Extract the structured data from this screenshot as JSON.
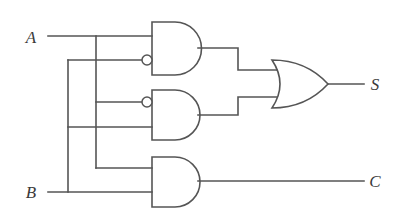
{
  "diagram": {
    "kind": "half-adder-logic-diagram",
    "background_color": "#ffffff",
    "line_color": "#555555",
    "label_color": "#3a3a3a"
  },
  "inputs": [
    {
      "id": "A",
      "label": "A",
      "x": 31,
      "y": 38,
      "wire_y": 36
    },
    {
      "id": "B",
      "label": "B",
      "x": 31,
      "y": 193,
      "wire_y": 192
    }
  ],
  "outputs": [
    {
      "id": "S",
      "label": "S",
      "x": 371,
      "y": 86,
      "wire_y": 84
    },
    {
      "id": "C",
      "label": "C",
      "x": 371,
      "y": 182,
      "wire_y": 181
    }
  ],
  "gates": [
    {
      "id": "and1",
      "type": "AND",
      "name": "and-gate-top",
      "x": 152,
      "y": 22,
      "width": 46,
      "height": 53,
      "inputs": [
        {
          "y": 36,
          "inverted": false
        },
        {
          "y": 60,
          "inverted": true
        }
      ],
      "output_y": 48
    },
    {
      "id": "and2",
      "type": "AND",
      "name": "and-gate-middle",
      "x": 152,
      "y": 90,
      "width": 46,
      "height": 50,
      "inputs": [
        {
          "y": 102,
          "inverted": true
        },
        {
          "y": 127,
          "inverted": false
        }
      ],
      "output_y": 115
    },
    {
      "id": "and3",
      "type": "AND",
      "name": "and-gate-bottom",
      "x": 152,
      "y": 157,
      "width": 46,
      "height": 50,
      "inputs": [
        {
          "y": 168,
          "inverted": false
        },
        {
          "y": 192,
          "inverted": false
        }
      ],
      "output_y": 181
    },
    {
      "id": "or1",
      "type": "OR",
      "name": "or-gate",
      "x": 272,
      "y": 60,
      "width": 56,
      "height": 48,
      "inputs": [
        {
          "y": 70,
          "inverted": false
        },
        {
          "y": 97,
          "inverted": false
        }
      ],
      "output_y": 84
    }
  ],
  "buses": [
    {
      "id": "a-bus",
      "name": "input-a-vertical-bus",
      "x": 96,
      "y_top": 36,
      "y_bottom": 168
    },
    {
      "id": "b-bus",
      "name": "input-b-vertical-bus",
      "x": 68,
      "y_top": 60,
      "y_bottom": 192
    }
  ],
  "wires": {
    "a_input_run": "M 48 36 L 152 36",
    "b_input_run": "M 48 192 L 152 192",
    "a_bus_vertical": "M 96 36 L 96 168",
    "a_bus_to_and3": "M 96 168 L 152 168",
    "b_bus_vertical": "M 68 60 L 68 192",
    "b_bus_to_and1_inv": "M 68 60 L 142 60",
    "a_bus_to_and2_inv": "M 96 102 L 142 102",
    "b_bus_to_and2_low": "M 68 127 L 152 127",
    "and1_out_to_or": "M 198 48 L 238 48 L 238 70 L 276 70",
    "and2_out_to_or": "M 198 115 L 238 115 L 238 97 L 276 97",
    "or_out_to_s": "M 328 84 L 364 84",
    "and3_out_to_c": "M 198 181 L 364 181"
  },
  "junctions": [
    {
      "name": "junction-a-top",
      "x": 96,
      "y": 36
    },
    {
      "name": "junction-a-mid",
      "x": 96,
      "y": 102
    },
    {
      "name": "junction-a-bottom",
      "x": 96,
      "y": 168
    },
    {
      "name": "junction-b-top",
      "x": 68,
      "y": 60
    },
    {
      "name": "junction-b-mid",
      "x": 68,
      "y": 127
    },
    {
      "name": "junction-b-bottom",
      "x": 68,
      "y": 192
    }
  ]
}
